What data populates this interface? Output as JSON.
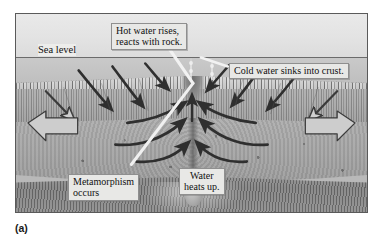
{
  "figure": {
    "caption": "(a)"
  },
  "labels": {
    "sea_level": "Sea level",
    "hot_water": "Hot water rises,\nreacts with rock.",
    "cold_water": "Cold water sinks into crust.",
    "metamorphism": "Metamorphism\noccurs",
    "water_heats": "Water\nheats up."
  },
  "icons": {
    "spread_arrow_left": "arrow-left-icon",
    "spread_arrow_right": "arrow-right-icon",
    "downwelling_arrow": "curved-down-arrow-icon",
    "upwelling_arrow": "curved-up-arrow-icon",
    "vent_plume": "plume-icon",
    "magma_chamber": "magma-chamber-icon"
  },
  "colors": {
    "frame_border": "#5a5a5a",
    "water": "#e3e3e3",
    "deep_water": "#c3c3c3",
    "upper_crust": "#a9a9a9",
    "lower_crust": "#a6a6a6",
    "mantle": "#7f7f7f",
    "arrow_dark": "#3a3a3a",
    "arrow_hollow_fill": "#cfcfcf",
    "callout_bg": "#e8e8e6",
    "text": "#111111"
  },
  "geometry": {
    "frame": {
      "x": 15,
      "y": 13,
      "width": 353,
      "height": 200
    },
    "sea_level_y": 56,
    "spread_arrow_count": 2,
    "downwelling_arrow_count": 6,
    "upwelling_arrow_count": 6
  }
}
